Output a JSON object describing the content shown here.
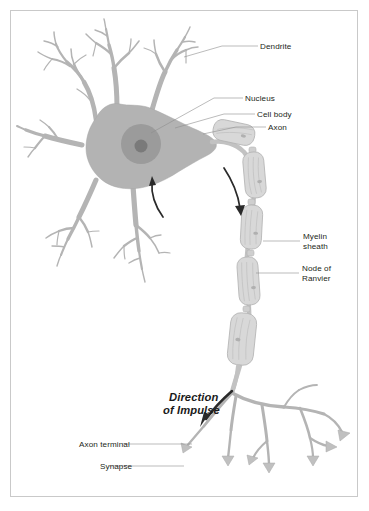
{
  "figure": {
    "background_color": "#ffffff",
    "frame_color": "#c9c9c9"
  },
  "colors": {
    "soma": "#b3b3b3",
    "nucleus": "#9b9b9b",
    "nucleolus": "#7a7a7a",
    "dendrite": "#b4b4b4",
    "myelin_fill": "#d8d8d8",
    "myelin_stroke": "#b2b2b2",
    "terminal": "#b4b4b4",
    "arrow": "#2a2a2a",
    "leader_line": "#8d8d8d",
    "label_text": "#231f20"
  },
  "labels": {
    "dendrite": "Dendrite",
    "nucleus": "Nucleus",
    "cell_body": "Cell body",
    "axon": "Axon",
    "myelin_sheath_line1": "Myelin",
    "myelin_sheath_line2": "sheath",
    "node_of_ranvier_line1": "Node of",
    "node_of_ranvier_line2": "Ranvier",
    "axon_terminal": "Axon terminal",
    "synapse": "Synapse",
    "direction_line1": "Direction",
    "direction_line2": "of Impulse"
  },
  "parts": [
    {
      "name": "dendrite",
      "label": "Dendrite"
    },
    {
      "name": "nucleus",
      "label": "Nucleus"
    },
    {
      "name": "cell-body",
      "label": "Cell body"
    },
    {
      "name": "axon",
      "label": "Axon"
    },
    {
      "name": "myelin-sheath",
      "label": "Myelin sheath"
    },
    {
      "name": "node-of-ranvier",
      "label": "Node of Ranvier"
    },
    {
      "name": "axon-terminal",
      "label": "Axon terminal"
    },
    {
      "name": "synapse",
      "label": "Synapse"
    }
  ],
  "annotations": {
    "impulse_direction": "Direction of Impulse"
  }
}
